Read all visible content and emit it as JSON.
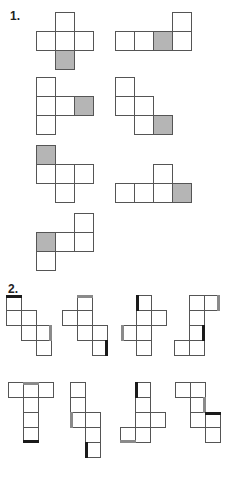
{
  "colors": {
    "outline": "#555555",
    "shade": "#b5b5b5",
    "edge_black": "#1a1a1a",
    "edge_gray": "#8a8a8a"
  },
  "sections": [
    {
      "label": "1.",
      "label_x": 10,
      "label_y": 10,
      "cell": 19,
      "nets": [
        {
          "cells": [
            [
              55,
              12
            ],
            [
              36,
              31
            ],
            [
              55,
              31
            ],
            [
              74,
              31
            ],
            [
              55,
              50,
              "s"
            ]
          ]
        },
        {
          "cells": [
            [
              172,
              12
            ],
            [
              115,
              31
            ],
            [
              134,
              31
            ],
            [
              153,
              31,
              "s"
            ],
            [
              172,
              31
            ]
          ]
        },
        {
          "cells": [
            [
              36,
              77
            ],
            [
              36,
              96
            ],
            [
              55,
              96
            ],
            [
              74,
              96,
              "s"
            ],
            [
              36,
              115
            ]
          ]
        },
        {
          "cells": [
            [
              115,
              77
            ],
            [
              115,
              96
            ],
            [
              134,
              96
            ],
            [
              134,
              115
            ],
            [
              153,
              115,
              "s"
            ]
          ]
        },
        {
          "cells": [
            [
              36,
              145,
              "s"
            ],
            [
              36,
              164
            ],
            [
              55,
              164
            ],
            [
              74,
              164
            ],
            [
              55,
              183
            ]
          ]
        },
        {
          "cells": [
            [
              153,
              164
            ],
            [
              115,
              183
            ],
            [
              134,
              183
            ],
            [
              153,
              183
            ],
            [
              172,
              183,
              "s"
            ]
          ]
        },
        {
          "cells": [
            [
              74,
              213
            ],
            [
              36,
              232,
              "s"
            ],
            [
              55,
              232
            ],
            [
              74,
              232
            ],
            [
              36,
              251
            ]
          ]
        }
      ]
    },
    {
      "label": "2.",
      "label_x": 8,
      "label_y": 283,
      "cell": 15,
      "nets": [
        {
          "cells": [
            [
              6,
              295
            ],
            [
              6,
              310
            ],
            [
              21,
              310
            ],
            [
              21,
              325
            ],
            [
              36,
              325
            ],
            [
              36,
              340
            ]
          ],
          "edges": [
            [
              6,
              295,
              "top",
              "b"
            ],
            [
              36,
              325,
              "right",
              "g"
            ]
          ]
        },
        {
          "cells": [
            [
              77,
              295
            ],
            [
              62,
              310
            ],
            [
              77,
              310
            ],
            [
              77,
              325
            ],
            [
              92,
              325
            ],
            [
              92,
              340
            ]
          ],
          "edges": [
            [
              77,
              295,
              "top",
              "g"
            ],
            [
              92,
              340,
              "right",
              "b"
            ]
          ]
        },
        {
          "cells": [
            [
              136,
              295
            ],
            [
              136,
              310
            ],
            [
              151,
              310
            ],
            [
              121,
              325
            ],
            [
              136,
              325
            ],
            [
              136,
              340
            ]
          ],
          "edges": [
            [
              136,
              295,
              "left",
              "b"
            ],
            [
              121,
              325,
              "left",
              "g"
            ]
          ]
        },
        {
          "cells": [
            [
              189,
              295
            ],
            [
              204,
              295
            ],
            [
              189,
              310
            ],
            [
              189,
              325
            ],
            [
              174,
              340
            ],
            [
              189,
              340
            ]
          ],
          "edges": [
            [
              204,
              295,
              "right",
              "g"
            ],
            [
              189,
              325,
              "right",
              "b"
            ]
          ]
        },
        {
          "cells": [
            [
              8,
              382
            ],
            [
              23,
              382
            ],
            [
              38,
              382
            ],
            [
              23,
              397
            ],
            [
              23,
              412
            ],
            [
              23,
              427
            ]
          ],
          "edges": [
            [
              23,
              382,
              "top",
              "g"
            ],
            [
              23,
              427,
              "bottom",
              "b"
            ]
          ]
        },
        {
          "cells": [
            [
              70,
              382
            ],
            [
              70,
              397
            ],
            [
              70,
              412
            ],
            [
              85,
              412
            ],
            [
              85,
              427
            ],
            [
              85,
              442
            ]
          ],
          "edges": [
            [
              70,
              412,
              "left",
              "g"
            ],
            [
              85,
              442,
              "left",
              "b"
            ]
          ]
        },
        {
          "cells": [
            [
              135,
              382
            ],
            [
              135,
              397
            ],
            [
              135,
              412
            ],
            [
              150,
              412
            ],
            [
              120,
              427
            ],
            [
              135,
              427
            ]
          ],
          "edges": [
            [
              135,
              382,
              "left",
              "b"
            ],
            [
              120,
              427,
              "bottom",
              "g"
            ]
          ]
        },
        {
          "cells": [
            [
              175,
              382
            ],
            [
              190,
              382
            ],
            [
              190,
              397
            ],
            [
              190,
              412
            ],
            [
              205,
              412
            ],
            [
              205,
              427
            ]
          ],
          "edges": [
            [
              190,
              397,
              "right",
              "g"
            ],
            [
              205,
              412,
              "top",
              "b"
            ]
          ]
        }
      ]
    }
  ]
}
